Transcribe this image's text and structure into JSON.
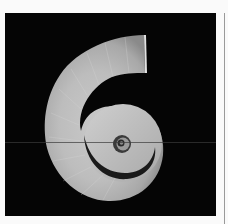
{
  "image": {
    "subject": "Spiral ram's horn shell on black background",
    "alt": "Coiled spiral shell photographed against a black background",
    "colors": {
      "frame": "#fafafa",
      "background": "#050505",
      "shell_light": "#d4d4d4",
      "shell_mid": "#b0b0b0",
      "shell_dark": "#7a7a7a",
      "side_rule": "#9a9a9a"
    }
  }
}
